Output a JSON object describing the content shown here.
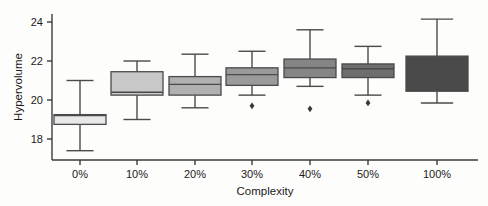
{
  "chart_data": {
    "type": "box",
    "title": "",
    "xlabel": "Complexity",
    "ylabel": "Hypervolume",
    "categories": [
      "0%",
      "10%",
      "20%",
      "30%",
      "40%",
      "50%",
      "100%"
    ],
    "ytick_labels": [
      "18",
      "20",
      "22",
      "24"
    ],
    "ytick_values": [
      18,
      20,
      22,
      24
    ],
    "ylim": [
      17.0,
      24.6
    ],
    "grid": false,
    "legend": null,
    "boxes": [
      {
        "category": "0%",
        "whisker_low": 17.4,
        "q1": 18.75,
        "median": 19.2,
        "q3": 19.25,
        "whisker_high": 21.0,
        "outliers": [],
        "fill": "#e8e8e8"
      },
      {
        "category": "10%",
        "whisker_low": 19.0,
        "q1": 20.25,
        "median": 20.4,
        "q3": 21.45,
        "whisker_high": 22.0,
        "outliers": [],
        "fill": "#c8c8c8"
      },
      {
        "category": "20%",
        "whisker_low": 19.6,
        "q1": 20.25,
        "median": 20.8,
        "q3": 21.2,
        "whisker_high": 22.35,
        "outliers": [],
        "fill": "#b0b0b0"
      },
      {
        "category": "30%",
        "whisker_low": 20.25,
        "q1": 20.75,
        "median": 21.3,
        "q3": 21.65,
        "whisker_high": 22.5,
        "outliers": [
          19.7
        ],
        "fill": "#9a9a9a"
      },
      {
        "category": "40%",
        "whisker_low": 20.7,
        "q1": 21.15,
        "median": 21.65,
        "q3": 22.1,
        "whisker_high": 23.6,
        "outliers": [
          19.55
        ],
        "fill": "#858585"
      },
      {
        "category": "50%",
        "whisker_low": 20.25,
        "q1": 21.15,
        "median": 21.6,
        "q3": 21.85,
        "whisker_high": 22.75,
        "outliers": [
          19.85
        ],
        "fill": "#6e6e6e"
      },
      {
        "category": "100%",
        "whisker_low": 19.85,
        "q1": 20.45,
        "median": 21.4,
        "q3": 22.25,
        "whisker_high": 24.15,
        "outliers": [],
        "fill": "#4a4a4a"
      }
    ],
    "colors": {
      "axis": "#3a3a3a",
      "box_stroke": "#4a4a4a",
      "background": "#fdfdfc"
    }
  }
}
